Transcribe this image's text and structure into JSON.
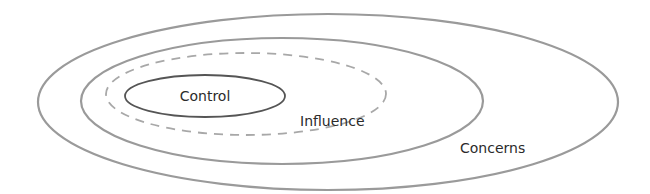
{
  "diagram": {
    "type": "nested-ellipses",
    "circles": [
      {
        "id": "concerns",
        "label": "Concerns",
        "style": "solid",
        "stroke": "#9a9a9a"
      },
      {
        "id": "influence",
        "label": "Influence",
        "style": "solid",
        "stroke": "#9a9a9a"
      },
      {
        "id": "influence-boundary",
        "label": "",
        "style": "dashed",
        "stroke": "#a8a8a8"
      },
      {
        "id": "control",
        "label": "Control",
        "style": "solid",
        "stroke": "#555555"
      }
    ],
    "labels": {
      "control": "Control",
      "influence": "Influence",
      "concerns": "Concerns"
    }
  }
}
